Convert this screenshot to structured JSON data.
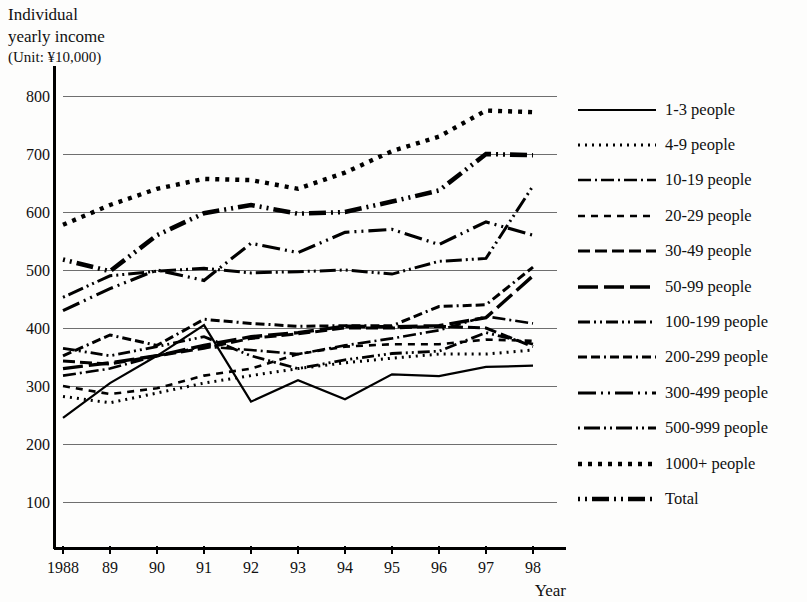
{
  "axis_title": {
    "line1": "Individual",
    "line2": "yearly income",
    "unit": "(Unit: ¥10,000)"
  },
  "x_axis_name": "Year",
  "chart_data": {
    "type": "line",
    "title": "Individual yearly income",
    "subtitle": "(Unit: ¥10,000)",
    "xlabel": "Year",
    "ylabel": "Individual yearly income (Unit: ¥10,000)",
    "ylim": [
      0,
      850
    ],
    "yticks": [
      100,
      200,
      300,
      400,
      500,
      600,
      700,
      800
    ],
    "ytick_labels": [
      "100",
      "200",
      "300",
      "400",
      "500",
      "600",
      "700",
      "800"
    ],
    "grid": true,
    "grid_axis": "y",
    "legend_position": "right",
    "x": [
      1988,
      1989,
      1990,
      1991,
      1992,
      1993,
      1994,
      1995,
      1996,
      1997,
      1998
    ],
    "categories": [
      "1988",
      "89",
      "90",
      "91",
      "92",
      "93",
      "94",
      "95",
      "96",
      "97",
      "98"
    ],
    "series": [
      {
        "name": "1-3 people",
        "dash": "solid",
        "width": 2.2,
        "values": [
          245,
          305,
          352,
          405,
          273,
          310,
          277,
          320,
          317,
          333,
          335
        ]
      },
      {
        "name": "4-9 people",
        "dash": "dotted",
        "width": 3.0,
        "values": [
          282,
          271,
          288,
          305,
          318,
          330,
          340,
          348,
          355,
          355,
          362
        ]
      },
      {
        "name": "10-19 people",
        "dash": "dashdot",
        "width": 2.6,
        "values": [
          318,
          330,
          352,
          368,
          362,
          355,
          370,
          382,
          396,
          420,
          408
        ]
      },
      {
        "name": "20-29 people",
        "dash": "smalldash",
        "width": 2.6,
        "values": [
          300,
          286,
          296,
          318,
          330,
          355,
          368,
          372,
          372,
          380,
          378
        ]
      },
      {
        "name": "30-49 people",
        "dash": "mediumdash",
        "width": 3.0,
        "values": [
          343,
          338,
          352,
          365,
          382,
          390,
          400,
          400,
          403,
          400,
          368
        ]
      },
      {
        "name": "50-99 people",
        "dash": "longdash",
        "width": 3.4,
        "values": [
          330,
          340,
          352,
          370,
          385,
          392,
          403,
          402,
          404,
          418,
          490
        ]
      },
      {
        "name": "100-199 people",
        "dash": "dashdotdot",
        "width": 2.8,
        "values": [
          365,
          352,
          368,
          385,
          352,
          330,
          345,
          356,
          360,
          392,
          372
        ]
      },
      {
        "name": "200-299 people",
        "dash": "dashdash-dot",
        "width": 3.0,
        "values": [
          352,
          388,
          370,
          415,
          408,
          403,
          404,
          404,
          437,
          440,
          505
        ]
      },
      {
        "name": "300-499 people",
        "dash": "longdash-dotdot",
        "width": 3.2,
        "values": [
          430,
          468,
          500,
          482,
          546,
          530,
          565,
          570,
          544,
          583,
          560
        ]
      },
      {
        "name": "500-999 people",
        "dash": "dotdash-long",
        "width": 3.0,
        "values": [
          453,
          490,
          498,
          503,
          495,
          497,
          500,
          493,
          515,
          520,
          645
        ]
      },
      {
        "name": "1000+ people",
        "dash": "bigdot",
        "width": 4.4,
        "values": [
          578,
          612,
          640,
          657,
          655,
          640,
          668,
          705,
          730,
          775,
          772
        ]
      },
      {
        "name": "Total",
        "dash": "dotdot-longdash",
        "width": 4.6,
        "values": [
          518,
          498,
          560,
          598,
          612,
          597,
          600,
          618,
          637,
          700,
          698
        ]
      }
    ]
  },
  "legend": {
    "items": [
      {
        "label": "1-3 people",
        "swatch": "solid"
      },
      {
        "label": "4-9 people",
        "swatch": "dotted"
      },
      {
        "label": "10-19 people",
        "swatch": "dashdot"
      },
      {
        "label": "20-29 people",
        "swatch": "smalldash"
      },
      {
        "label": "30-49 people",
        "swatch": "mediumdash"
      },
      {
        "label": "50-99 people",
        "swatch": "longdash"
      },
      {
        "label": "100-199 people",
        "swatch": "dashdotdot"
      },
      {
        "label": "200-299 people",
        "swatch": "dashdash-dot"
      },
      {
        "label": "300-499 people",
        "swatch": "longdash-dotdot"
      },
      {
        "label": "500-999 people",
        "swatch": "dotdash-long"
      },
      {
        "label": "1000+ people",
        "swatch": "bigdot"
      },
      {
        "label": "Total",
        "swatch": "dotdot-longdash"
      }
    ]
  },
  "colors": {
    "ink": "#000000",
    "grid": "#6f6f6f",
    "background": "#fdfdfc"
  }
}
